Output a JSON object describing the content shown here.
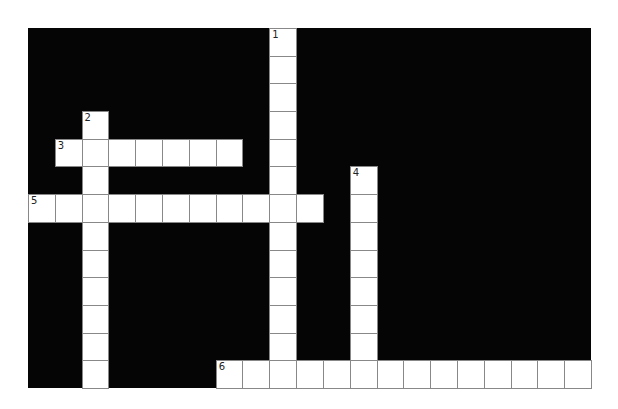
{
  "puzzle": {
    "type": "crossword",
    "cols": 21,
    "rows": 13,
    "colors": {
      "block": "#050505",
      "cell": "#ffffff",
      "border": "#888888"
    },
    "entries": [
      {
        "number": "1",
        "direction": "down",
        "row": 0,
        "col": 9,
        "length": 13
      },
      {
        "number": "2",
        "direction": "down",
        "row": 3,
        "col": 2,
        "length": 10
      },
      {
        "number": "3",
        "direction": "across",
        "row": 4,
        "col": 1,
        "length": 7
      },
      {
        "number": "4",
        "direction": "down",
        "row": 5,
        "col": 12,
        "length": 8
      },
      {
        "number": "5",
        "direction": "across",
        "row": 6,
        "col": 0,
        "length": 11
      },
      {
        "number": "6",
        "direction": "across",
        "row": 12,
        "col": 7,
        "length": 14
      }
    ]
  }
}
